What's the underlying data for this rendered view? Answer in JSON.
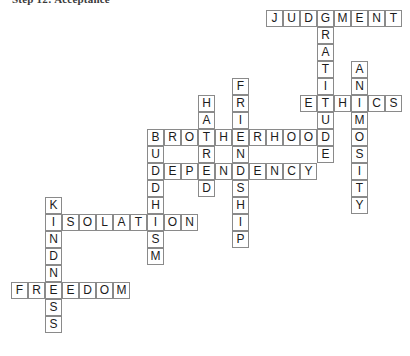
{
  "header": {
    "text": "Step 12: Acceptance"
  },
  "puzzle": {
    "title": "crossword-grid",
    "cell_size": 17,
    "origin_x": 11,
    "origin_y": 10,
    "grid_color": "#8a8a8a",
    "letter_color": "#1c1c1c",
    "background": "#ffffff",
    "entries": [
      {
        "answer": "JUDGMENT",
        "direction": "across",
        "row": 0,
        "col": 15
      },
      {
        "answer": "GRATITUDE",
        "direction": "down",
        "row": 0,
        "col": 18
      },
      {
        "answer": "ANIMOSITY",
        "direction": "down",
        "row": 3,
        "col": 20
      },
      {
        "answer": "ETHICS",
        "direction": "across",
        "row": 5,
        "col": 17
      },
      {
        "answer": "HATRED",
        "direction": "down",
        "row": 5,
        "col": 11
      },
      {
        "answer": "FRIENDSHIP",
        "direction": "down",
        "row": 4,
        "col": 13
      },
      {
        "answer": "BROTHERHOOD",
        "direction": "across",
        "row": 7,
        "col": 8
      },
      {
        "answer": "BUDDHISM",
        "direction": "down",
        "row": 7,
        "col": 8
      },
      {
        "answer": "DEPENDENCY",
        "direction": "across",
        "row": 9,
        "col": 8
      },
      {
        "answer": "ISOLATION",
        "direction": "across",
        "row": 12,
        "col": 2
      },
      {
        "answer": "KINDNESS",
        "direction": "down",
        "row": 11,
        "col": 2
      },
      {
        "answer": "FREEDOM",
        "direction": "across",
        "row": 16,
        "col": 0
      }
    ]
  }
}
